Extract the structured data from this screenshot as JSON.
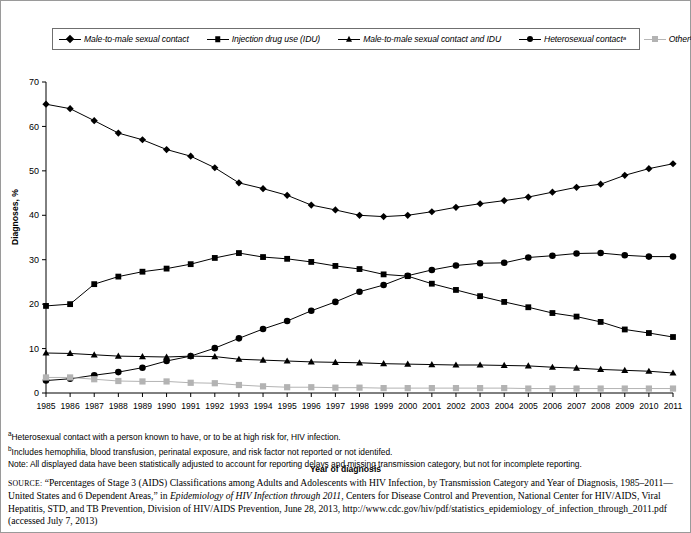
{
  "legend": {
    "items": [
      {
        "label": "Male-to-male sexual contact",
        "marker": "diamond-marker",
        "color": "#000000"
      },
      {
        "label": "Injection drug use (IDU)",
        "marker": "square-marker",
        "color": "#000000"
      },
      {
        "label": "Male-to-male sexual contact and IDU",
        "marker": "triangle-marker",
        "color": "#000000"
      },
      {
        "label": "Heterosexual contactᵃ",
        "marker": "circle-marker",
        "color": "#000000"
      },
      {
        "label": "Otherᵇ",
        "marker": "gray-square-marker",
        "color": "#b3b3b3"
      }
    ]
  },
  "axes": {
    "y_title": "Diagnoses, %",
    "x_title": "Year of diagnosis",
    "y_ticks": [
      "0",
      "10",
      "20",
      "30",
      "40",
      "50",
      "60",
      "70"
    ],
    "x_ticks": [
      "1985",
      "1986",
      "1987",
      "1988",
      "1989",
      "1990",
      "1991",
      "1992",
      "1993",
      "1994",
      "1995",
      "1996",
      "1997",
      "1998",
      "1999",
      "2000",
      "2001",
      "2002",
      "2003",
      "2004",
      "2005",
      "2006",
      "2007",
      "2008",
      "2009",
      "2010",
      "2011"
    ]
  },
  "footnotes": {
    "a": "Heterosexual contact with a person known to have, or to be at high risk for, HIV infection.",
    "b": "Includes hemophilia, blood transfusion, perinatal exposure, and risk factor not reported or not identifed.",
    "note": "Note: All displayed data have been statistically adjusted to account for reporting delays and missing transmission category, but not for incomplete reporting."
  },
  "source": {
    "label": "SOURCE:",
    "text_1": " “Percentages of Stage 3 (AIDS) Classifications among Adults and Adolescents with HIV Infection, by Transmission Category and Year of Diagnosis, 1985–2011—United States and 6 Dependent Areas,” in ",
    "italic_1": "Epidemiology of HIV Infection through 2011",
    "text_2": ", Centers for Disease Control and Prevention, National Center for HIV/AIDS, Viral Hepatitis, STD, and TB Prevention, Division of HIV/AIDS Prevention, June 28, 2013, http://www.cdc.gov/hiv/pdf/statistics_epidemiology_of_infection_through_2011.pdf (accessed July 7, 2013)"
  },
  "chart_data": {
    "type": "line",
    "title": "",
    "xlabel": "Year of diagnosis",
    "ylabel": "Diagnoses, %",
    "ylim": [
      0,
      70
    ],
    "xlim": [
      1985,
      2011
    ],
    "grid": false,
    "legend_position": "top",
    "x": [
      1985,
      1986,
      1987,
      1988,
      1989,
      1990,
      1991,
      1992,
      1993,
      1994,
      1995,
      1996,
      1997,
      1998,
      1999,
      2000,
      2001,
      2002,
      2003,
      2004,
      2005,
      2006,
      2007,
      2008,
      2009,
      2010,
      2011
    ],
    "series": [
      {
        "name": "Male-to-male sexual contact",
        "marker": "diamond",
        "color": "#000000",
        "values": [
          65.0,
          64.0,
          61.3,
          58.5,
          57.0,
          54.8,
          53.3,
          50.7,
          47.3,
          46.0,
          44.5,
          42.3,
          41.2,
          40.0,
          39.7,
          40.0,
          40.8,
          41.8,
          42.6,
          43.3,
          44.1,
          45.2,
          46.3,
          47.0,
          49.0,
          50.5,
          51.6
        ]
      },
      {
        "name": "Injection drug use (IDU)",
        "marker": "square",
        "color": "#000000",
        "values": [
          19.6,
          20.0,
          24.5,
          26.2,
          27.3,
          28.0,
          29.0,
          30.4,
          31.5,
          30.6,
          30.2,
          29.5,
          28.6,
          27.9,
          26.7,
          26.3,
          24.6,
          23.2,
          21.8,
          20.5,
          19.3,
          18.0,
          17.2,
          16.0,
          14.3,
          13.5,
          12.6
        ]
      },
      {
        "name": "Male-to-male sexual contact and IDU",
        "marker": "triangle",
        "color": "#000000",
        "values": [
          9.0,
          8.9,
          8.6,
          8.3,
          8.2,
          8.1,
          8.3,
          8.2,
          7.6,
          7.4,
          7.2,
          7.0,
          6.9,
          6.8,
          6.6,
          6.5,
          6.4,
          6.3,
          6.3,
          6.2,
          6.1,
          5.8,
          5.6,
          5.3,
          5.1,
          4.9,
          4.5
        ]
      },
      {
        "name": "Heterosexual contact",
        "marker": "circle",
        "color": "#000000",
        "values": [
          2.8,
          3.2,
          4.0,
          4.7,
          5.7,
          7.2,
          8.3,
          10.1,
          12.3,
          14.4,
          16.2,
          18.5,
          20.5,
          22.8,
          24.3,
          26.4,
          27.7,
          28.7,
          29.2,
          29.3,
          30.5,
          30.9,
          31.4,
          31.5,
          31.0,
          30.7,
          30.7
        ]
      },
      {
        "name": "Other",
        "marker": "gray-square",
        "color": "#b3b3b3",
        "values": [
          3.5,
          3.5,
          3.1,
          2.7,
          2.6,
          2.6,
          2.3,
          2.2,
          1.8,
          1.5,
          1.3,
          1.3,
          1.2,
          1.2,
          1.1,
          1.1,
          1.1,
          1.1,
          1.1,
          1.1,
          1.0,
          1.0,
          1.0,
          1.0,
          1.0,
          1.0,
          1.0
        ]
      }
    ]
  }
}
